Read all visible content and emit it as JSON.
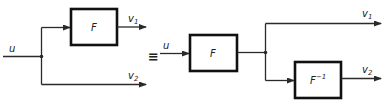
{
  "diagram": {
    "type": "block-diagram-equivalence",
    "equivalence_symbol": "≡",
    "left": {
      "input_label": "u",
      "block_label": "F",
      "output1": {
        "name": "v",
        "sub": "1"
      },
      "output2": {
        "name": "v",
        "sub": "2"
      }
    },
    "right": {
      "input_label": "u",
      "block1_label": "F",
      "block2_label": "F",
      "block2_sup": "−1",
      "output1": {
        "name": "v",
        "sub": "1"
      },
      "output2": {
        "name": "v",
        "sub": "2"
      }
    },
    "colors": {
      "stroke": "#2a2a2a",
      "box_border": "#111111",
      "background": "#ffffff"
    }
  }
}
